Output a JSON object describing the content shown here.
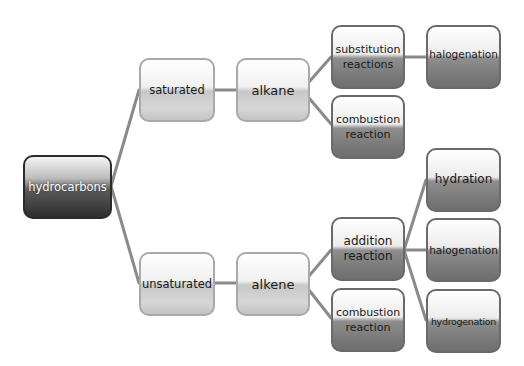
{
  "diagram": {
    "type": "tree",
    "root": {
      "label": "hydrocarbons",
      "children": [
        {
          "label": "saturated",
          "children": [
            {
              "label": "alkane",
              "children": [
                {
                  "label": "substitution reactions",
                  "children": [
                    {
                      "label": "halogenation"
                    }
                  ]
                },
                {
                  "label": "combustion reaction"
                }
              ]
            }
          ]
        },
        {
          "label": "unsaturated",
          "children": [
            {
              "label": "alkene",
              "children": [
                {
                  "label": "addition reaction",
                  "children": [
                    {
                      "label": "hydration"
                    },
                    {
                      "label": "halogenation"
                    },
                    {
                      "label": "hydrogenation"
                    }
                  ]
                },
                {
                  "label": "combustion reaction"
                }
              ]
            }
          ]
        }
      ]
    }
  },
  "nodes": {
    "hydrocarbons": "hydrocarbons",
    "saturated": "saturated",
    "alkane": "alkane",
    "substitution": "substitution reactions",
    "halogenation_top": "halogenation",
    "combustion_top": "combustion reaction",
    "unsaturated": "unsaturated",
    "alkene": "alkene",
    "addition": "addition reaction",
    "combustion_bottom": "combustion reaction",
    "hydration": "hydration",
    "halogenation_mid": "halogenation",
    "hydrogenation": "hydrogenation"
  },
  "colors": {
    "connector": "#8a8a8a",
    "root_dark": "#2e2e2e",
    "light_box": "#d6d6d6",
    "dark_box": "#7a7a7a"
  }
}
